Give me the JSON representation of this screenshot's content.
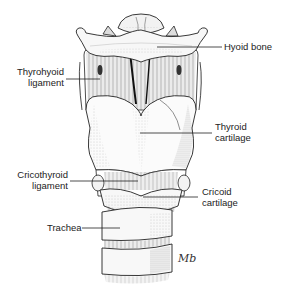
{
  "diagram": {
    "labels": [
      {
        "id": "hyoid-bone",
        "lines": [
          "Hyoid bone"
        ],
        "side": "right"
      },
      {
        "id": "thyrohyoid-ligament",
        "lines": [
          "Thyrohyoid",
          "ligament"
        ],
        "side": "left"
      },
      {
        "id": "thyroid-cartilage",
        "lines": [
          "Thyroid",
          "cartilage"
        ],
        "side": "right"
      },
      {
        "id": "cricothyroid-ligament",
        "lines": [
          "Cricothyroid",
          "ligament"
        ],
        "side": "left"
      },
      {
        "id": "cricoid-cartilage",
        "lines": [
          "Cricoid",
          "cartilage"
        ],
        "side": "right"
      },
      {
        "id": "trachea",
        "lines": [
          "Trachea"
        ],
        "side": "left"
      }
    ],
    "signature": "Mb",
    "colors": {
      "ink": "#222222",
      "paper": "#ffffff",
      "stipple": "#9a9a9a"
    }
  }
}
